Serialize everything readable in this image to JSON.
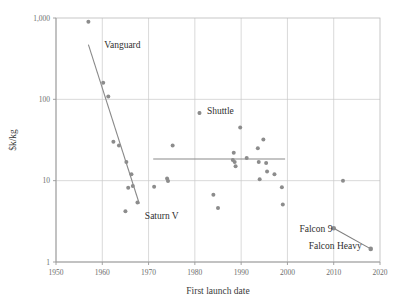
{
  "chart_data": {
    "type": "scatter",
    "title": "",
    "xlabel": "First launch date",
    "ylabel": "$k/kg",
    "xlim": [
      1950,
      2020
    ],
    "ylim": [
      1,
      1000
    ],
    "yscale": "log",
    "xticks": [
      "1950",
      "1960",
      "1970",
      "1980",
      "1990",
      "2000",
      "2010",
      "2020"
    ],
    "xtick_values": [
      1950,
      1960,
      1970,
      1980,
      1990,
      2000,
      2010,
      2020
    ],
    "yticks": [
      "1",
      "10",
      "100",
      "1,000"
    ],
    "ytick_values": [
      1,
      10,
      100,
      1000
    ],
    "grid": true,
    "legend": "none",
    "marker_color": "#8c8c8c",
    "trend_color": "#8a8a8a",
    "grid_color": "#c8c8c8",
    "points": [
      {
        "x": 1957.0,
        "y": 900
      },
      {
        "x": 1960.2,
        "y": 160
      },
      {
        "x": 1961.3,
        "y": 108
      },
      {
        "x": 1962.4,
        "y": 30
      },
      {
        "x": 1963.6,
        "y": 27
      },
      {
        "x": 1965.2,
        "y": 17
      },
      {
        "x": 1966.3,
        "y": 12
      },
      {
        "x": 1965.6,
        "y": 8.2
      },
      {
        "x": 1966.6,
        "y": 8.6
      },
      {
        "x": 1967.6,
        "y": 5.4
      },
      {
        "x": 1965.0,
        "y": 4.2
      },
      {
        "x": 1971.2,
        "y": 8.4
      },
      {
        "x": 1974.0,
        "y": 10.6
      },
      {
        "x": 1974.2,
        "y": 9.9
      },
      {
        "x": 1975.2,
        "y": 27
      },
      {
        "x": 1981.0,
        "y": 68
      },
      {
        "x": 1984.0,
        "y": 6.7
      },
      {
        "x": 1985.0,
        "y": 4.6
      },
      {
        "x": 1988.4,
        "y": 22
      },
      {
        "x": 1988.2,
        "y": 18
      },
      {
        "x": 1988.6,
        "y": 17
      },
      {
        "x": 1988.8,
        "y": 15
      },
      {
        "x": 1989.8,
        "y": 45
      },
      {
        "x": 1991.2,
        "y": 19
      },
      {
        "x": 1993.6,
        "y": 25
      },
      {
        "x": 1993.8,
        "y": 17
      },
      {
        "x": 1994.0,
        "y": 10.4
      },
      {
        "x": 1994.8,
        "y": 32
      },
      {
        "x": 1995.4,
        "y": 16.5
      },
      {
        "x": 1995.6,
        "y": 13
      },
      {
        "x": 1997.2,
        "y": 12
      },
      {
        "x": 1998.8,
        "y": 8.3
      },
      {
        "x": 1999.0,
        "y": 5.1
      },
      {
        "x": 2012.0,
        "y": 10
      }
    ],
    "trend_lines": [
      {
        "name": "early-decline-trend",
        "x1": 1957.0,
        "y1": 470,
        "x2": 1968.0,
        "y2": 5.2
      },
      {
        "name": "plateau-trend",
        "x1": 1971.0,
        "y1": 18.5,
        "x2": 1999.5,
        "y2": 18.5
      }
    ],
    "connector_lines": [
      {
        "name": "falcon-connector",
        "x1": 2010.0,
        "y1": 2.6,
        "x2": 2018.0,
        "y2": 1.45
      }
    ],
    "highlight_points": [
      {
        "name": "falcon-9-point",
        "x": 2010.0,
        "y": 2.6
      },
      {
        "name": "falcon-heavy-point",
        "x": 2018.0,
        "y": 1.45
      },
      {
        "name": "shuttle-legend-marker",
        "x": 1981.0,
        "y": 68
      }
    ],
    "annotations": [
      {
        "name": "vanguard",
        "label": "Vanguard",
        "x": 1960.4,
        "y": 430
      },
      {
        "name": "shuttle",
        "label": "Shuttle",
        "x": 1982.6,
        "y": 66
      },
      {
        "name": "saturn-v",
        "label": "Saturn V",
        "x": 1969.2,
        "y": 3.35
      },
      {
        "name": "falcon-9",
        "label": "Falcon 9",
        "x": 2002.6,
        "y": 2.35
      },
      {
        "name": "falcon-heavy",
        "label": "Falcon Heavy",
        "x": 2004.6,
        "y": 1.45
      }
    ]
  }
}
